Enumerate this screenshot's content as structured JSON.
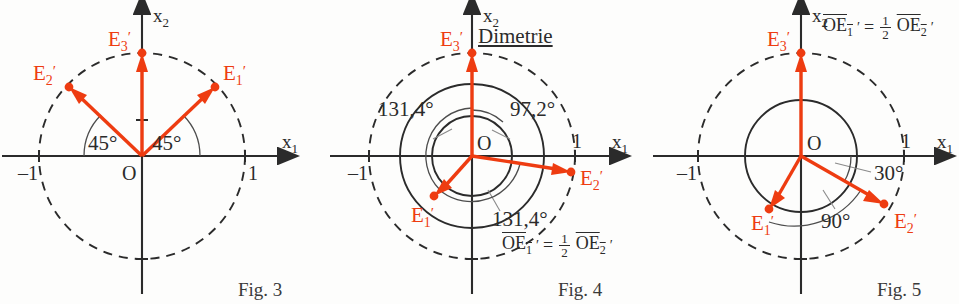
{
  "page": {
    "background_color": "#fdfdfc",
    "vector_color": "#ee3c11",
    "line_color": "#2b2b2b"
  },
  "figures": [
    {
      "id": "fig3",
      "caption": "Fig. 3",
      "title": "",
      "axes": {
        "x_label": "x",
        "x_sub": "1",
        "y_label": "x",
        "y_sub": "2"
      },
      "origin_label": "O",
      "ticks": [
        {
          "label": "–1",
          "position": "x-negative-one"
        },
        {
          "label": "1",
          "position": "x-positive-one"
        }
      ],
      "angles": [
        {
          "value": "45°",
          "between": "x1-axis-and-E1"
        },
        {
          "value": "45°",
          "between": "x1-axis-and-E2"
        }
      ],
      "vectors": [
        {
          "name": "E1",
          "label": "E",
          "sub": "1",
          "prime": "′",
          "angle_deg": 45,
          "length": 1.0
        },
        {
          "name": "E2",
          "label": "E",
          "sub": "2",
          "prime": "′",
          "angle_deg": 135,
          "length": 1.0
        },
        {
          "name": "E3",
          "label": "E",
          "sub": "3",
          "prime": "′",
          "angle_deg": 90,
          "length": 1.0
        }
      ],
      "formula": null
    },
    {
      "id": "fig4",
      "caption": "Fig. 4",
      "title": "Dimetrie",
      "axes": {
        "x_label": "x",
        "x_sub": "1",
        "y_label": "x",
        "y_sub": "2"
      },
      "origin_label": "O",
      "ticks": [
        {
          "label": "–1",
          "position": "x-negative-one"
        },
        {
          "label": "1",
          "position": "x-positive-one"
        }
      ],
      "angles": [
        {
          "value": "131,4°",
          "between": "E1-and-E3"
        },
        {
          "value": "97,2°",
          "between": "E3-and-E2"
        },
        {
          "value": "131,4°",
          "between": "E1-and-E2"
        }
      ],
      "vectors": [
        {
          "name": "E1",
          "label": "E",
          "sub": "1",
          "prime": "′",
          "angle_deg": 221.4,
          "length": 0.5
        },
        {
          "name": "E2",
          "label": "E",
          "sub": "2",
          "prime": "′",
          "angle_deg": 352.8,
          "length": 1.0
        },
        {
          "name": "E3",
          "label": "E",
          "sub": "3",
          "prime": "′",
          "angle_deg": 90,
          "length": 1.0
        }
      ],
      "formula": {
        "left": "OE",
        "left_sub": "1",
        "left_prime": "′",
        "equals": "=",
        "frac_num": "1",
        "frac_den": "2",
        "right": "OE",
        "right_sub": "2",
        "right_prime": "′"
      }
    },
    {
      "id": "fig5",
      "caption": "Fig. 5",
      "title": "",
      "axes": {
        "x_label": "x",
        "x_sub": "1",
        "y_label": "x",
        "y_sub": "2"
      },
      "origin_label": "O",
      "ticks": [
        {
          "label": "–1",
          "position": "x-negative-one"
        },
        {
          "label": "1",
          "position": "x-positive-one"
        }
      ],
      "angles": [
        {
          "value": "30°",
          "between": "x1-axis-and-E2"
        },
        {
          "value": "90°",
          "between": "E1-and-E2"
        }
      ],
      "vectors": [
        {
          "name": "E1",
          "label": "E",
          "sub": "1",
          "prime": "′",
          "angle_deg": 240,
          "length": 0.5
        },
        {
          "name": "E2",
          "label": "E",
          "sub": "2",
          "prime": "′",
          "angle_deg": 330,
          "length": 1.0
        },
        {
          "name": "E3",
          "label": "E",
          "sub": "3",
          "prime": "′",
          "angle_deg": 90,
          "length": 1.0
        }
      ],
      "formula": {
        "left": "OE",
        "left_sub": "1",
        "left_prime": "′",
        "equals": "=",
        "frac_num": "1",
        "frac_den": "2",
        "right": "OE",
        "right_sub": "2",
        "right_prime": "′"
      }
    }
  ]
}
